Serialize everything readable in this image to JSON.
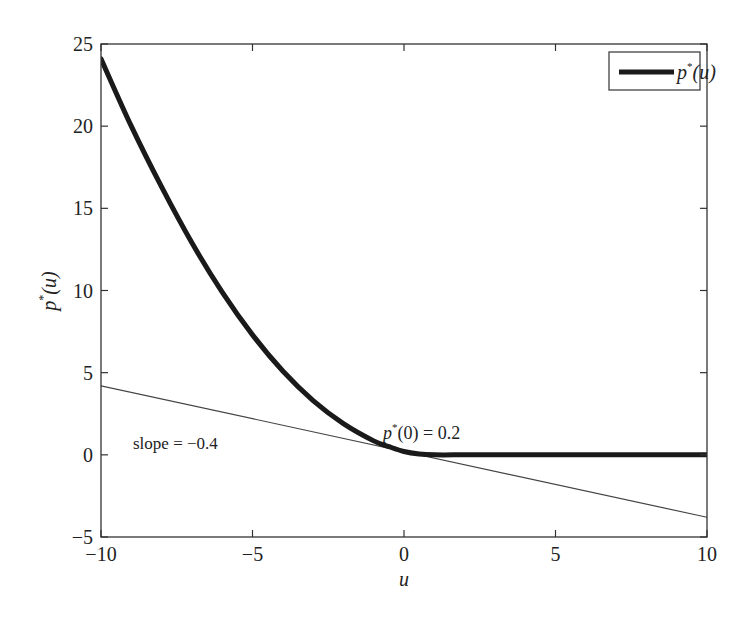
{
  "chart_data": {
    "type": "line",
    "title": "",
    "xlabel": "u",
    "ylabel": "p*(u)",
    "xlim": [
      -10,
      10
    ],
    "ylim": [
      -5,
      25
    ],
    "xticks": [
      -10,
      -5,
      0,
      5,
      10
    ],
    "xtick_labels": [
      "−10",
      "−5",
      "0",
      "5",
      "10"
    ],
    "yticks": [
      -5,
      0,
      5,
      10,
      15,
      20,
      25
    ],
    "ytick_labels": [
      "−5",
      "0",
      "5",
      "10",
      "15",
      "20",
      "25"
    ],
    "grid": false,
    "legend": {
      "position": "upper right",
      "entries": [
        "p*(u)"
      ]
    },
    "series": [
      {
        "name": "p*(u)",
        "style": "thick solid",
        "color": "#1a1a1a",
        "x": [
          -10,
          -9,
          -8,
          -7,
          -6,
          -5,
          -4,
          -3,
          -2,
          -1,
          -0.5,
          0,
          0.5,
          1,
          2,
          3,
          4,
          5,
          6,
          7,
          8,
          9,
          10
        ],
        "y": [
          24.1,
          20.0,
          16.3,
          12.9,
          9.9,
          7.3,
          5.1,
          3.3,
          1.9,
          0.85,
          0.5,
          0.2,
          0.05,
          0.0,
          0.0,
          0.0,
          0.0,
          0.0,
          0.0,
          0.0,
          0.0,
          0.0,
          0.0
        ]
      },
      {
        "name": "tangent at u=0",
        "style": "thin solid",
        "color": "#444444",
        "x": [
          -10,
          10
        ],
        "y": [
          4.2,
          -3.8
        ]
      }
    ],
    "annotations": [
      {
        "text": "slope = −0.4",
        "x": -8.5,
        "y": 0.5
      },
      {
        "text": "p*(0) = 0.2",
        "x": -0.7,
        "y": 2.2
      }
    ]
  },
  "labels": {
    "xlabel": "u",
    "ylabel_main": "p",
    "ylabel_sup": "*",
    "ylabel_rest": "(u)",
    "legend_main": "p",
    "legend_sup": "*",
    "legend_rest": "(u)",
    "annot_slope": "slope = −0.4",
    "annot_p0_main": "p",
    "annot_p0_sup": "*",
    "annot_p0_rest": "(0) = 0.2"
  }
}
